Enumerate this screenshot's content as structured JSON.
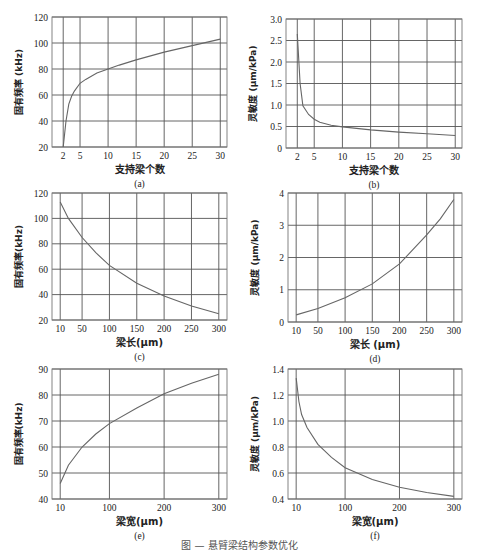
{
  "figure": {
    "caption": "图 — 悬臂梁结构参数优化"
  },
  "chart_data": [
    {
      "id": "a",
      "type": "line",
      "label": "(a)",
      "xlabel": "支持梁个数",
      "ylabel": "固有频率 (kHz)",
      "xlim": [
        0,
        31.2
      ],
      "ylim": [
        20,
        120
      ],
      "xticks": [
        2,
        5,
        10,
        15,
        20,
        25,
        30
      ],
      "yticks": [
        20,
        40,
        60,
        80,
        100,
        120
      ],
      "grid": true,
      "x": [
        2,
        2.5,
        3,
        3.5,
        4,
        5,
        6,
        8,
        10,
        12,
        15,
        20,
        25,
        30
      ],
      "y": [
        20,
        40,
        53,
        59,
        63,
        69,
        72,
        77,
        80,
        83,
        87,
        93,
        98,
        103
      ]
    },
    {
      "id": "b",
      "type": "line",
      "label": "(b)",
      "xlabel": "支持梁个数",
      "ylabel": "灵敏度 (μm/kPa)",
      "xlim": [
        0,
        31.2
      ],
      "ylim": [
        0,
        3.0
      ],
      "xticks": [
        2,
        5,
        10,
        15,
        20,
        25,
        30
      ],
      "yticks": [
        0,
        0.5,
        1.0,
        1.5,
        2.0,
        2.5,
        3.0
      ],
      "ytick_labels": [
        "0",
        "0.5",
        "1.0",
        "1.5",
        "2.0",
        "2.5",
        "3.0"
      ],
      "grid": true,
      "x": [
        2,
        2.5,
        3,
        4,
        5,
        6,
        8,
        10,
        15,
        20,
        25,
        30
      ],
      "y": [
        2.65,
        1.5,
        0.98,
        0.78,
        0.67,
        0.6,
        0.53,
        0.49,
        0.42,
        0.37,
        0.33,
        0.29
      ]
    },
    {
      "id": "c",
      "type": "line",
      "label": "(c)",
      "xlabel": "梁长(μm)",
      "ylabel": "固有频率(kHz)",
      "xlim": [
        -5,
        315
      ],
      "ylim": [
        20,
        120
      ],
      "xticks": [
        10,
        50,
        100,
        150,
        200,
        250,
        300
      ],
      "yticks": [
        20,
        40,
        60,
        80,
        100,
        120
      ],
      "grid": true,
      "x": [
        10,
        25,
        50,
        75,
        100,
        150,
        200,
        250,
        300
      ],
      "y": [
        113,
        100,
        85,
        73,
        63,
        49,
        39,
        31,
        25
      ]
    },
    {
      "id": "d",
      "type": "line",
      "label": "(d)",
      "xlabel": "梁长 (μm)",
      "ylabel": "灵敏度 (μm/kPa)",
      "xlim": [
        -5,
        315
      ],
      "ylim": [
        0,
        4
      ],
      "xticks": [
        10,
        50,
        100,
        150,
        200,
        250,
        300
      ],
      "yticks": [
        0,
        1,
        2,
        3,
        4
      ],
      "grid": true,
      "x": [
        10,
        50,
        100,
        150,
        200,
        250,
        275,
        300
      ],
      "y": [
        0.22,
        0.42,
        0.75,
        1.18,
        1.8,
        2.7,
        3.2,
        3.8
      ]
    },
    {
      "id": "e",
      "type": "line",
      "label": "(e)",
      "xlabel": "梁宽(μm)",
      "ylabel": "固有频率(kHz)",
      "xlim": [
        -5,
        315
      ],
      "ylim": [
        40,
        90
      ],
      "xticks": [
        10,
        100,
        200,
        300
      ],
      "yticks": [
        40,
        50,
        60,
        70,
        80,
        90
      ],
      "grid": true,
      "x": [
        10,
        25,
        50,
        75,
        100,
        150,
        200,
        250,
        300
      ],
      "y": [
        46,
        53,
        60,
        65,
        69,
        75,
        80.5,
        84.5,
        88
      ]
    },
    {
      "id": "f",
      "type": "line",
      "label": "(f)",
      "xlabel": "梁宽(μm)",
      "ylabel": "灵敏度 (μm/kPa)",
      "xlim": [
        -5,
        315
      ],
      "ylim": [
        0.4,
        1.4
      ],
      "xticks": [
        10,
        100,
        200,
        300
      ],
      "yticks": [
        0.4,
        0.6,
        0.8,
        1.0,
        1.2,
        1.4
      ],
      "ytick_labels": [
        "0.4",
        "0.6",
        "0.8",
        "1.0",
        "1.2",
        "1.4"
      ],
      "grid": true,
      "x": [
        10,
        15,
        20,
        30,
        50,
        75,
        100,
        150,
        200,
        250,
        300
      ],
      "y": [
        1.33,
        1.15,
        1.05,
        0.95,
        0.82,
        0.72,
        0.64,
        0.55,
        0.49,
        0.45,
        0.42
      ]
    }
  ]
}
